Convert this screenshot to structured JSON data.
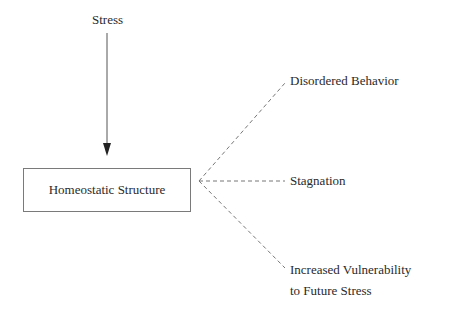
{
  "diagram": {
    "input": {
      "label": "Stress"
    },
    "center": {
      "label": "Homeostatic Structure"
    },
    "outcomes": [
      {
        "label": "Disordered Behavior"
      },
      {
        "label": "Stagnation"
      },
      {
        "label_line1": "Increased Vulnerability",
        "label_line2": "to Future Stress"
      }
    ],
    "colors": {
      "text": "#2a2a2a",
      "line": "#555555",
      "box_border": "#7a7a7a"
    },
    "edges": [
      {
        "from": "Stress",
        "to": "Homeostatic Structure",
        "style": "solid-arrow"
      },
      {
        "from": "Homeostatic Structure",
        "to": "Disordered Behavior",
        "style": "dashed"
      },
      {
        "from": "Homeostatic Structure",
        "to": "Stagnation",
        "style": "dashed"
      },
      {
        "from": "Homeostatic Structure",
        "to": "Increased Vulnerability to Future Stress",
        "style": "dashed"
      }
    ]
  }
}
